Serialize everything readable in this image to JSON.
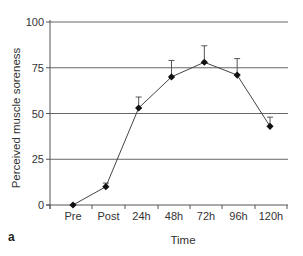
{
  "chart_data": {
    "type": "line",
    "title": "",
    "panel_label": "a",
    "xlabel": "Time",
    "ylabel": "Perceived muscle soreness",
    "categories": [
      "Pre",
      "Post",
      "24h",
      "48h",
      "72h",
      "96h",
      "120h"
    ],
    "series": [
      {
        "name": "Perceived muscle soreness",
        "values": [
          0,
          10,
          53,
          70,
          78,
          71,
          43
        ],
        "error_upper": [
          0,
          2,
          6,
          9,
          9,
          9,
          5
        ],
        "marker": "diamond",
        "color": "#111111"
      }
    ],
    "ylim": [
      0,
      100
    ],
    "yticks": [
      0,
      25,
      50,
      75,
      100
    ],
    "grid": true,
    "legend": null
  }
}
